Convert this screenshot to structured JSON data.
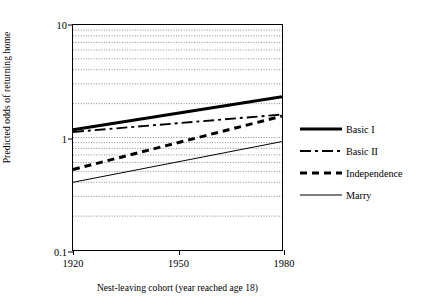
{
  "chart_data": {
    "type": "line",
    "title": "",
    "xlabel": "Nest-leaving cohort (year reached age 18)",
    "ylabel": "Predicted odds of returning home",
    "yscale": "log",
    "ylim": [
      0.1,
      10
    ],
    "xlim": [
      1920,
      1980
    ],
    "grid": true,
    "grid_style": "dotted horizontal minor log gridlines",
    "legend_position": "right",
    "y_ticks": [
      {
        "value": 10,
        "label": "10"
      },
      {
        "value": 1,
        "label": "1"
      },
      {
        "value": 0.1,
        "label": "0.1"
      }
    ],
    "x_ticks": [
      {
        "value": 1920,
        "label": "1920"
      },
      {
        "value": 1950,
        "label": "1950"
      },
      {
        "value": 1980,
        "label": "1980"
      }
    ],
    "x": [
      1920,
      1980
    ],
    "series": [
      {
        "name": "Basic I",
        "style": "thick-solid",
        "values": [
          1.17,
          2.3
        ]
      },
      {
        "name": "Basic II",
        "style": "dash-dot",
        "values": [
          1.12,
          1.6
        ]
      },
      {
        "name": "Independence",
        "style": "dashed",
        "values": [
          0.52,
          1.55
        ]
      },
      {
        "name": "Marry",
        "style": "thin-solid",
        "values": [
          0.4,
          0.92
        ]
      }
    ]
  },
  "legend": {
    "items": [
      {
        "label": "Basic I"
      },
      {
        "label": "Basic II"
      },
      {
        "label": "Independence"
      },
      {
        "label": "Marry"
      }
    ]
  }
}
